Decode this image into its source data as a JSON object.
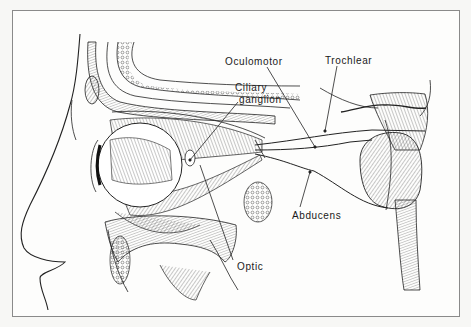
{
  "figure": {
    "frame": {
      "x": 12,
      "y": 10,
      "width": 448,
      "height": 307,
      "border_color": "#8a8a8a",
      "background": "#fdfdfc"
    },
    "ink_color": "#222222"
  },
  "labels": {
    "oculomotor": {
      "text": "Oculomotor",
      "x": 225,
      "y": 55
    },
    "trochlear": {
      "text": "Trochlear",
      "x": 325,
      "y": 54
    },
    "ciliary_line1": {
      "text": "Ciliary",
      "x": 235,
      "y": 83
    },
    "ciliary_line2": {
      "text": "ganglion",
      "x": 239,
      "y": 95
    },
    "abducens": {
      "text": "Abducens",
      "x": 292,
      "y": 210
    },
    "optic": {
      "text": "Optic",
      "x": 237,
      "y": 262
    }
  },
  "leaders": [
    {
      "name": "oculomotor",
      "from": [
        267,
        67
      ],
      "to": [
        315,
        147
      ]
    },
    {
      "name": "trochlear",
      "from": [
        337,
        66
      ],
      "to": [
        325,
        131
      ]
    },
    {
      "name": "ciliary-ganglion",
      "from": [
        238,
        102
      ],
      "to": [
        190,
        160
      ]
    },
    {
      "name": "abducens",
      "from": [
        300,
        207
      ],
      "to": [
        310,
        172
      ]
    },
    {
      "name": "optic",
      "from": [
        233,
        262
      ],
      "to": [
        200,
        160
      ]
    }
  ],
  "nerves": [
    {
      "name": "trochlear-nerve",
      "path": "M255,145 C300,140 330,133 372,130 L425,130"
    },
    {
      "name": "oculomotor-nerve",
      "path": "M255,150 C290,150 320,148 350,140 C365,136 380,137 372,138"
    },
    {
      "name": "abducens-nerve",
      "path": "M255,153 C285,160 305,170 315,170 C340,185 360,205 385,207"
    }
  ]
}
